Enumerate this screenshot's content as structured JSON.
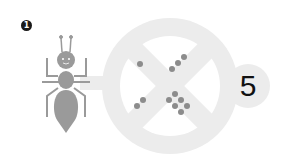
{
  "problem": {
    "number": "1",
    "answer": "5",
    "creature": "ant",
    "dot_groups": {
      "top_left": 1,
      "top_right": 3,
      "bottom_left": 2,
      "bottom_right": 6
    },
    "colors": {
      "ant": "#9a9a9a",
      "ring": "#ececec",
      "dots": "#8c8c8c",
      "text": "#111111"
    }
  }
}
